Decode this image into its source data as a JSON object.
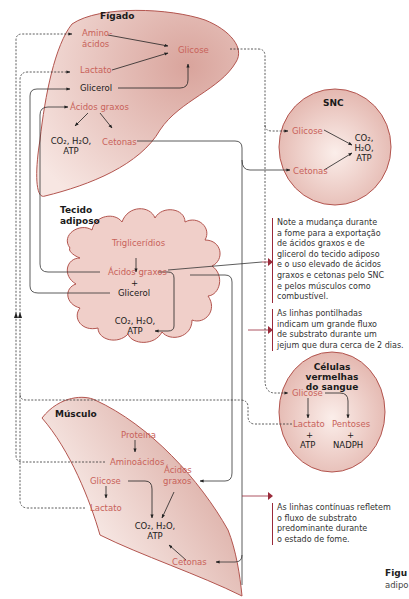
{
  "organs": {
    "liver": {
      "title": "Fígado",
      "amino": "Amino- ácidos",
      "amino_1": "Amino-",
      "amino_2": "ácidos",
      "lactate": "Lactato",
      "glycerol": "Glicerol",
      "glucose": "Glicose",
      "fatty_acids": "Ácidos graxos",
      "products_1": "CO₂, H₂O,",
      "products_2": "ATP",
      "ketones": "Cetonas"
    },
    "cns": {
      "title": "SNC",
      "glucose": "Glicose",
      "ketones": "Cetonas",
      "products_1": "CO₂,",
      "products_2": "H₂O,",
      "products_3": "ATP"
    },
    "adipose": {
      "title_1": "Tecido",
      "title_2": "adiposo",
      "triglycerides": "Triglicerídios",
      "fatty_acids": "Ácidos graxos",
      "plus": "+",
      "glycerol": "Glicerol",
      "products_1": "CO₂, H₂O,",
      "products_2": "ATP"
    },
    "rbc": {
      "title_1": "Células",
      "title_2": "vermelhas",
      "title_3": "do sangue",
      "glucose": "Glicose",
      "lactate": "Lactato",
      "pentoses": "Pentoses",
      "plus": "+",
      "atp": "ATP",
      "nadph": "NADPH"
    },
    "muscle": {
      "title": "Músculo",
      "protein": "Proteína",
      "amino": "Aminoácidos",
      "fatty_1": "Ácidos",
      "fatty_2": "graxos",
      "glucose": "Glicose",
      "lactate": "Lactato",
      "products_1": "CO₂, H₂O,",
      "products_2": "ATP",
      "ketones": "Cetonas"
    }
  },
  "notes": {
    "note1": [
      "Note a mudança durante",
      "a fome para a exportação",
      "de ácidos graxos e de",
      "glicerol do tecido adiposo",
      "e o uso elevado de ácidos",
      "graxos e cetonas pelo SNC",
      "e pelos músculos como",
      "combustível."
    ],
    "note2": [
      "As linhas pontilhadas",
      "indicam um grande fluxo",
      "de substrato durante um",
      "jejum que dura cerca de 2 dias."
    ],
    "note3": [
      "As linhas contínuas refletem",
      "o fluxo de substrato",
      "predominante durante",
      "o estado de fome."
    ]
  },
  "caption": {
    "line1": "Figu",
    "line2": "adipo"
  },
  "colors": {
    "organ_fill": "#e7b9b0",
    "organ_stroke": "#b3554f",
    "label_red": "#c8625a",
    "note_bar": "#9a2a3a"
  }
}
